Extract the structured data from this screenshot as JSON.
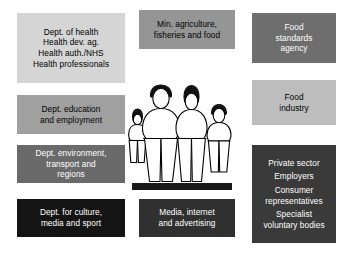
{
  "diagram": {
    "background_color": "#ffffff",
    "boxes": [
      {
        "id": "dept-of-health",
        "name": "dept-of-health-box",
        "lines": [
          "Dept. of health",
          "Health dev. ag.",
          "Health auth./NHS",
          "Health professionals"
        ],
        "fill": "#d5d5d5",
        "text_color": "#000000",
        "x": 17,
        "y": 13,
        "w": 108,
        "h": 70
      },
      {
        "id": "min-agriculture",
        "name": "min-agriculture-fisheries-food-box",
        "lines": [
          "Min. agriculture,",
          "fisheries and food"
        ],
        "fill": "#959595",
        "text_color": "#000000",
        "x": 139,
        "y": 10,
        "w": 96,
        "h": 39
      },
      {
        "id": "food-standards-agency",
        "name": "food-standards-agency-box",
        "lines": [
          "Food",
          "standards",
          "agency"
        ],
        "fill": "#6e6e6e",
        "text_color": "#ffffff",
        "x": 252,
        "y": 13,
        "w": 84,
        "h": 50
      },
      {
        "id": "dept-education-employment",
        "name": "dept-education-employment-box",
        "lines": [
          "Dept. education",
          "and employment"
        ],
        "fill": "#a0a0a0",
        "text_color": "#000000",
        "x": 17,
        "y": 95,
        "w": 108,
        "h": 39
      },
      {
        "id": "food-industry",
        "name": "food-industry-box",
        "lines": [
          "Food",
          "industry"
        ],
        "fill": "#bdbdbd",
        "text_color": "#000000",
        "x": 252,
        "y": 80,
        "w": 84,
        "h": 45
      },
      {
        "id": "dept-environment-transport-regions",
        "name": "dept-environment-transport-regions-box",
        "lines": [
          "Dept. environment,",
          "transport and",
          "regions"
        ],
        "fill": "#6a6a6a",
        "text_color": "#ffffff",
        "x": 17,
        "y": 145,
        "w": 108,
        "h": 38
      },
      {
        "id": "private-sector-group",
        "name": "private-sector-stakeholders-box",
        "lines": [
          "Private sector",
          "Employers",
          "Consumer",
          "representatives",
          "Specialist",
          "voluntary bodies"
        ],
        "fill": "#3a3a3a",
        "text_color": "#ffffff",
        "x": 252,
        "y": 145,
        "w": 84,
        "h": 98
      },
      {
        "id": "dept-culture-media-sport",
        "name": "dept-culture-media-sport-box",
        "lines": [
          "Dept. for culture,",
          "media and sport"
        ],
        "fill": "#141414",
        "text_color": "#ffffff",
        "x": 17,
        "y": 199,
        "w": 108,
        "h": 38
      },
      {
        "id": "media-internet-advertising",
        "name": "media-internet-advertising-box",
        "lines": [
          "Media, internet",
          "and advertising"
        ],
        "fill": "#303030",
        "text_color": "#ffffff",
        "x": 139,
        "y": 199,
        "w": 96,
        "h": 38
      }
    ],
    "illustration": {
      "name": "family-figures-illustration",
      "description": "Line drawing of a family of four standing on a ground bar",
      "outline_color": "#000000",
      "fill_color": "#ffffff",
      "hair_color": "#000000",
      "ground_color": "#1a1a1a",
      "figures": [
        "small-child",
        "adult-male",
        "adult-female",
        "child"
      ]
    }
  }
}
